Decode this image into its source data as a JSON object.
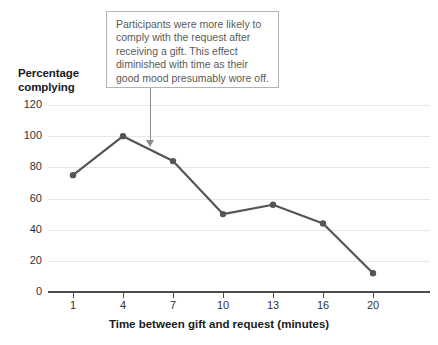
{
  "chart_data": {
    "type": "line",
    "title": "",
    "xlabel": "Time between gift and request (minutes)",
    "ylabel": "Percentage complying",
    "categories": [
      "1",
      "4",
      "7",
      "10",
      "13",
      "16",
      "20"
    ],
    "values": [
      75,
      100,
      84,
      50,
      56,
      44,
      12
    ],
    "series": [
      {
        "name": "Percentage complying",
        "values": [
          75,
          100,
          84,
          50,
          56,
          44,
          12
        ]
      }
    ],
    "ylim": [
      0,
      120
    ],
    "yticks": [
      0,
      20,
      40,
      60,
      80,
      100,
      120
    ],
    "ytick_labels": [
      "0",
      "20",
      "40",
      "60",
      "80",
      "100",
      "120"
    ],
    "xtick_labels": [
      "1",
      "4",
      "7",
      "10",
      "13",
      "16",
      "20"
    ],
    "grid": "horizontal",
    "legend": "none",
    "line_color": "#555555",
    "marker_color": "#555555",
    "grid_color": "#e6e6e6",
    "axis_color": "#4d4d4d",
    "annotations": [
      {
        "text": "Participants were more likely to comply with the request after receiving a gift. This effect diminished with time as their good mood presumably wore off.",
        "points_to_x": "between 4 and 7",
        "border_color": "#b3b3b3",
        "text_color": "#5a5a5a"
      }
    ]
  },
  "axes": {
    "y_title_line1": "Percentage",
    "y_title_line2": "complying",
    "x_title": "Time between gift and request (minutes)"
  }
}
